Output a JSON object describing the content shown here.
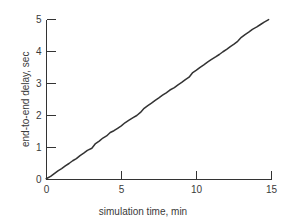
{
  "chart_data": {
    "type": "line",
    "title": "",
    "xlabel": "simulation time, min",
    "ylabel": "end-to-end delay, sec",
    "xlim": [
      0,
      15
    ],
    "ylim": [
      0,
      5
    ],
    "xticks": [
      "0",
      "5",
      "10",
      "15"
    ],
    "xtick_values": [
      0,
      5,
      10,
      15
    ],
    "yticks": [
      "0",
      "1",
      "2",
      "3",
      "4",
      "5"
    ],
    "ytick_values": [
      0,
      1,
      2,
      3,
      4,
      5
    ],
    "grid": false,
    "legend": null,
    "legend_position": "none",
    "tick_direction": "in",
    "line_color": "#333333",
    "axis_color": "#333333",
    "background_color": "#ffffff",
    "series": [
      {
        "name": "end-to-end delay",
        "x": [
          0.0,
          0.25,
          0.5,
          0.75,
          1.0,
          1.25,
          1.5,
          1.75,
          2.0,
          2.25,
          2.5,
          2.75,
          3.0,
          3.25,
          3.5,
          3.75,
          4.0,
          4.25,
          4.5,
          4.75,
          5.0,
          5.25,
          5.5,
          5.75,
          6.0,
          6.25,
          6.5,
          6.75,
          7.0,
          7.25,
          7.5,
          7.75,
          8.0,
          8.25,
          8.5,
          8.75,
          9.0,
          9.25,
          9.5,
          9.75,
          10.0,
          10.25,
          10.5,
          10.75,
          11.0,
          11.25,
          11.5,
          11.75,
          12.0,
          12.25,
          12.5,
          12.75,
          13.0,
          13.25,
          13.5,
          13.75,
          14.0,
          14.25,
          14.5,
          14.8
        ],
        "y": [
          0.0,
          0.08,
          0.17,
          0.26,
          0.33,
          0.42,
          0.5,
          0.59,
          0.66,
          0.76,
          0.84,
          0.93,
          1.0,
          1.1,
          1.18,
          1.28,
          1.35,
          1.46,
          1.52,
          1.6,
          1.68,
          1.78,
          1.86,
          1.95,
          2.02,
          2.12,
          2.2,
          2.29,
          2.37,
          2.46,
          2.54,
          2.63,
          2.71,
          2.8,
          2.88,
          2.97,
          3.05,
          3.14,
          3.22,
          3.32,
          3.4,
          3.49,
          3.57,
          3.66,
          3.74,
          3.83,
          3.91,
          4.0,
          4.08,
          4.17,
          4.25,
          4.34,
          4.42,
          4.51,
          4.59,
          4.68,
          4.76,
          4.84,
          4.92,
          5.0
        ]
      }
    ],
    "slope_sec_per_min": 0.338
  }
}
